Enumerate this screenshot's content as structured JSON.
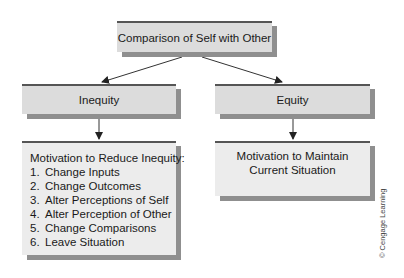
{
  "diagram": {
    "title_box": "Comparison of Self with Other",
    "branches": [
      {
        "label": "Inequity",
        "outcome": {
          "heading": "Motivation to Reduce Inequity:",
          "items": [
            {
              "num": "1.",
              "text": "Change Inputs"
            },
            {
              "num": "2.",
              "text": "Change Outcomes"
            },
            {
              "num": "3.",
              "text": "Alter Perceptions of Self"
            },
            {
              "num": "4.",
              "text": "Alter Perception of Other"
            },
            {
              "num": "5.",
              "text": "Change Comparisons"
            },
            {
              "num": "6.",
              "text": "Leave Situation"
            }
          ]
        }
      },
      {
        "label": "Equity",
        "outcome": {
          "lines": [
            "Motivation to Maintain",
            "Current Situation"
          ]
        }
      }
    ],
    "credit": "© Cengage Learning"
  },
  "colors": {
    "box_fill": "#dcdcdc",
    "box_fill_light": "#ececec",
    "box_shadow": "#8f8f8f",
    "box_top_border": "#555555",
    "arrow": "#222222"
  }
}
